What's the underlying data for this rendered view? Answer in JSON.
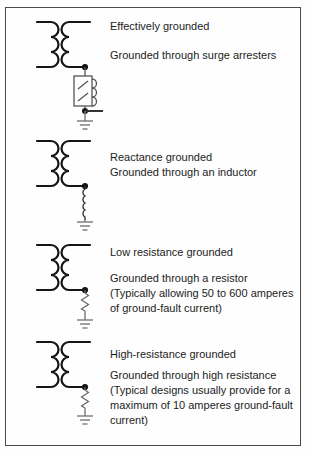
{
  "figure": {
    "background_color": "#fefefe",
    "border_color": "#4a4a4a",
    "line_color": "#161616",
    "component_color": "#666666",
    "sections": [
      {
        "id": "effectively-grounded",
        "title": "Effectively grounded",
        "lines": [
          "Grounded through surge arresters"
        ],
        "symbols": [
          "transformer",
          "junction-dot",
          "surge-arrester",
          "neutral-tap",
          "ground"
        ]
      },
      {
        "id": "reactance-grounded",
        "title": "Reactance grounded",
        "lines": [
          "Grounded through an inductor"
        ],
        "symbols": [
          "transformer",
          "junction-dot",
          "inductor",
          "ground"
        ]
      },
      {
        "id": "low-resistance-grounded",
        "title": "Low resistance grounded",
        "lines": [
          "Grounded through a resistor",
          "(Typically allowing 50 to 600 amperes",
          "of ground-fault current)"
        ],
        "symbols": [
          "transformer",
          "junction-dot",
          "resistor",
          "ground"
        ]
      },
      {
        "id": "high-resistance-grounded",
        "title": "High-resistance grounded",
        "lines": [
          "Grounded through high resistance",
          "(Typical designs usually provide for a",
          "maximum of 10 amperes ground-fault",
          "current)"
        ],
        "symbols": [
          "transformer",
          "junction-dot",
          "resistor",
          "ground"
        ]
      }
    ]
  }
}
